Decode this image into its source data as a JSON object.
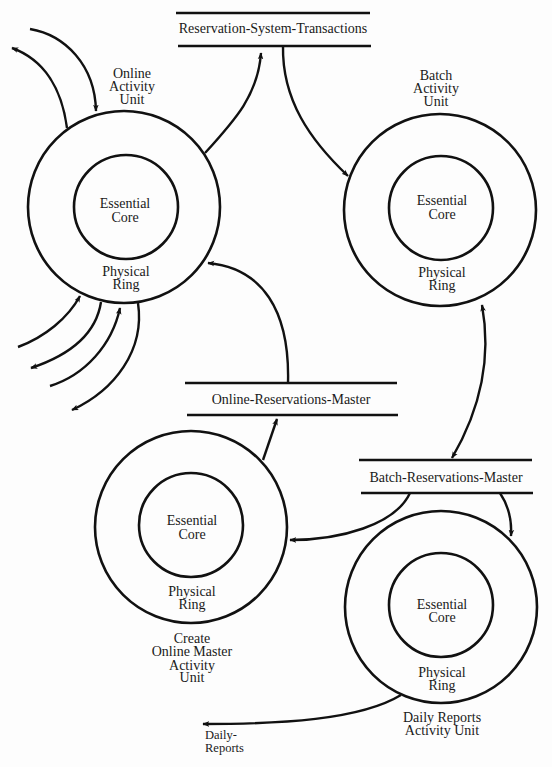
{
  "diagram": {
    "colors": {
      "ink": "#111111",
      "background": "#fdfdfd"
    },
    "data_stores": {
      "reservation_system_transactions": {
        "label": "Reservation-System-Transactions"
      },
      "online_reservations_master": {
        "label": "Online-Reservations-Master"
      },
      "batch_reservations_master": {
        "label": "Batch-Reservations-Master"
      }
    },
    "activity_units": {
      "online": {
        "name_lines": [
          "Online",
          "Activity",
          "Unit"
        ],
        "core_lines": [
          "Essential",
          "Core"
        ],
        "ring_lines": [
          "Physical",
          "Ring"
        ]
      },
      "batch": {
        "name_lines": [
          "Batch",
          "Activity",
          "Unit"
        ],
        "core_lines": [
          "Essential",
          "Core"
        ],
        "ring_lines": [
          "Physical",
          "Ring"
        ]
      },
      "create_online_master": {
        "name_lines": [
          "Create",
          "Online Master",
          "Activity",
          "Unit"
        ],
        "core_lines": [
          "Essential",
          "Core"
        ],
        "ring_lines": [
          "Physical",
          "Ring"
        ]
      },
      "daily_reports": {
        "name_lines": [
          "Daily Reports",
          "Activity Unit"
        ],
        "core_lines": [
          "Essential",
          "Core"
        ],
        "ring_lines": [
          "Physical",
          "Ring"
        ]
      }
    },
    "external_flows": {
      "daily_reports_output": {
        "label_lines": [
          "Daily-",
          "Reports"
        ]
      }
    }
  }
}
